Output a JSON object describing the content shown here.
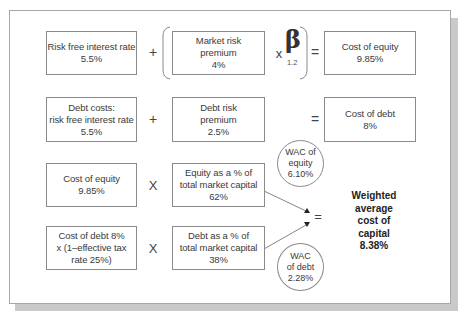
{
  "diagram": {
    "row1": {
      "risk_free": {
        "label": "Risk free interest rate",
        "value": "5.5%"
      },
      "plus": "+",
      "market_risk": {
        "label_line1": "Market risk",
        "label_line2": "premium",
        "value": "4%"
      },
      "times": "x",
      "beta_symbol": "β",
      "beta_value": "1.2",
      "equals": "=",
      "cost_of_equity": {
        "label": "Cost of equity",
        "value": "9.85%"
      }
    },
    "row2": {
      "debt_costs": {
        "label_line1": "Debt costs:",
        "label_line2": "risk free interest rate",
        "value": "5.5%"
      },
      "plus": "+",
      "debt_risk": {
        "label_line1": "Debt risk",
        "label_line2": "premium",
        "value": "2.5%"
      },
      "equals": "=",
      "cost_of_debt": {
        "label": "Cost of debt",
        "value": "8%"
      }
    },
    "row3": {
      "cost_of_equity": {
        "label": "Cost of equity",
        "value": "9.85%"
      },
      "times": "X",
      "equity_share": {
        "label_line1": "Equity as a % of",
        "label_line2": "total market capital",
        "value": "62%"
      },
      "wac_equity": {
        "line1": "WAC of",
        "line2": "equity",
        "value": "6.10%"
      }
    },
    "row4": {
      "cost_of_debt_after_tax": {
        "line1": "Cost of debt 8%",
        "line2": "x (1–effective tax",
        "line3": "rate 25%)"
      },
      "times": "X",
      "debt_share": {
        "label_line1": "Debt as a % of",
        "label_line2": "total market capital",
        "value": "38%"
      },
      "wac_debt": {
        "line1": "WAC",
        "line2": "of debt",
        "value": "2.28%"
      }
    },
    "result": {
      "equals": "=",
      "line1": "Weighted",
      "line2": "average",
      "line3": "cost of",
      "line4": "capital",
      "value": "8.38%"
    },
    "colors": {
      "border": "#8a8a8a",
      "text": "#3a3a3a",
      "shadow": "#c9c9c9"
    }
  }
}
